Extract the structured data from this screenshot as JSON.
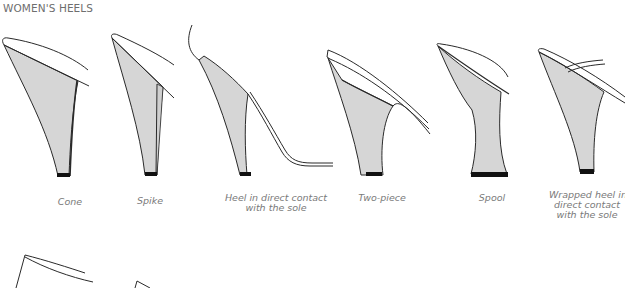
{
  "title": "WOMEN'S HEELS",
  "colors": {
    "heel_fill": "#d6d6d6",
    "outline": "#2a2a2a",
    "top_lift": "#111111",
    "caption_text": "#7a7a7a",
    "title_text": "#6e6e6e"
  },
  "heels": [
    {
      "id": "cone",
      "caption_lines": [
        "Cone"
      ],
      "icon": "cone-heel-icon"
    },
    {
      "id": "spike",
      "caption_lines": [
        "Spike"
      ],
      "icon": "spike-heel-icon"
    },
    {
      "id": "direct-contact",
      "caption_lines": [
        "Heel in direct contact",
        "with the sole"
      ],
      "icon": "direct-contact-heel-icon"
    },
    {
      "id": "two-piece",
      "caption_lines": [
        "Two-piece"
      ],
      "icon": "two-piece-heel-icon"
    },
    {
      "id": "spool",
      "caption_lines": [
        "Spool"
      ],
      "icon": "spool-heel-icon"
    },
    {
      "id": "wrapped",
      "caption_lines": [
        "Wrapped heel in",
        "direct contact",
        "with the sole"
      ],
      "icon": "wrapped-heel-icon"
    }
  ],
  "second_row": [
    {
      "id": "partial-heel-7",
      "icon": "partial-heel-icon"
    },
    {
      "id": "partial-heel-8",
      "icon": "partial-heel-icon"
    }
  ]
}
